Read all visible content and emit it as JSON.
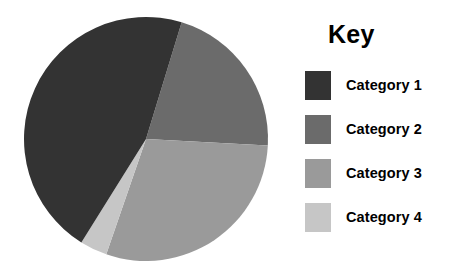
{
  "legend": {
    "title": "Key",
    "position": "right",
    "items": [
      {
        "label": "Category 1",
        "color": "#333333"
      },
      {
        "label": "Category 2",
        "color": "#6b6b6b"
      },
      {
        "label": "Category 3",
        "color": "#9a9a9a"
      },
      {
        "label": "Category 4",
        "color": "#c6c6c6"
      }
    ]
  },
  "chart_data": {
    "type": "pie",
    "title": "",
    "subtitle": "",
    "xlabel": "",
    "ylabel": "",
    "grid": false,
    "legend_position": "right",
    "categories": [
      "Category 1",
      "Category 2",
      "Category 3",
      "Category 4"
    ],
    "values": [
      54,
      21,
      21,
      4
    ],
    "unit": "percent",
    "colors": [
      "#333333",
      "#6b6b6b",
      "#9a9a9a",
      "#c6c6c6"
    ],
    "slices": [
      {
        "label": "Category 1",
        "value": 54,
        "color": "#333333",
        "start_angle": 17,
        "end_angle": 212
      },
      {
        "label": "Category 2",
        "value": 21,
        "color": "#6b6b6b",
        "start_angle": 17,
        "end_angle": 93
      },
      {
        "label": "Category 3",
        "value": 21,
        "color": "#9a9a9a",
        "start_angle": 93,
        "end_angle": 199
      },
      {
        "label": "Category 4",
        "value": 4,
        "color": "#c6c6c6",
        "start_angle": 199,
        "end_angle": 212
      }
    ],
    "data_labels_shown": false,
    "center_x": 146,
    "center_y": 139,
    "radius": 122
  }
}
